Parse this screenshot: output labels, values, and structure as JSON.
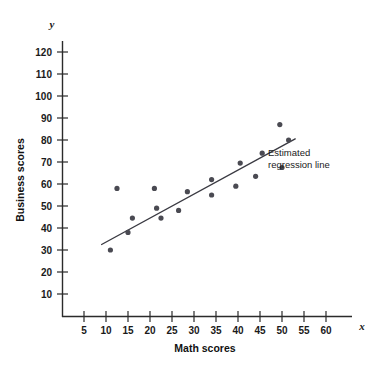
{
  "chart_data": {
    "type": "scatter",
    "title": "",
    "xlabel": "Math scores",
    "ylabel": "Business scores",
    "x_axis_variable": "x",
    "y_axis_variable": "y",
    "xlim": [
      0,
      63
    ],
    "ylim": [
      0,
      126
    ],
    "xticks": [
      5,
      10,
      15,
      20,
      25,
      30,
      35,
      40,
      45,
      50,
      55,
      60
    ],
    "yticks": [
      10,
      20,
      30,
      40,
      50,
      60,
      70,
      80,
      90,
      100,
      110,
      120
    ],
    "xtick_labels": [
      "5",
      "10",
      "15",
      "20",
      "25",
      "30",
      "35",
      "40",
      "45",
      "50",
      "55",
      "60"
    ],
    "ytick_labels": [
      "10",
      "20",
      "30",
      "40",
      "50",
      "60",
      "70",
      "80",
      "90",
      "100",
      "110",
      "120"
    ],
    "grid": false,
    "legend": false,
    "marker_color": "#4a4a52",
    "line_color": "#3a3a42",
    "points": [
      {
        "x": 11.0,
        "y": 30.0
      },
      {
        "x": 12.5,
        "y": 58.0
      },
      {
        "x": 15.0,
        "y": 38.0
      },
      {
        "x": 16.0,
        "y": 44.5
      },
      {
        "x": 21.0,
        "y": 58.0
      },
      {
        "x": 21.5,
        "y": 49.0
      },
      {
        "x": 22.5,
        "y": 44.5
      },
      {
        "x": 26.5,
        "y": 48.0
      },
      {
        "x": 28.5,
        "y": 56.5
      },
      {
        "x": 34.0,
        "y": 62.0
      },
      {
        "x": 34.0,
        "y": 55.0
      },
      {
        "x": 39.5,
        "y": 59.0
      },
      {
        "x": 40.5,
        "y": 69.5
      },
      {
        "x": 44.0,
        "y": 63.5
      },
      {
        "x": 45.5,
        "y": 74.0
      },
      {
        "x": 49.5,
        "y": 87.0
      },
      {
        "x": 50.0,
        "y": 67.5
      },
      {
        "x": 51.5,
        "y": 80.0
      }
    ],
    "regression_line": {
      "label": "Estimated regression line",
      "x_start": 9.0,
      "y_start": 32.5,
      "x_end": 53.0,
      "y_end": 80.5
    },
    "annotations": [
      {
        "text_line_1": "Estimated",
        "text_line_2": "regression line"
      }
    ]
  },
  "annotation": {
    "line1": "Estimated",
    "line2": "regression line"
  },
  "axes": {
    "x_title": "Math scores",
    "y_title": "Business scores",
    "x_var": "x",
    "y_var": "y"
  }
}
